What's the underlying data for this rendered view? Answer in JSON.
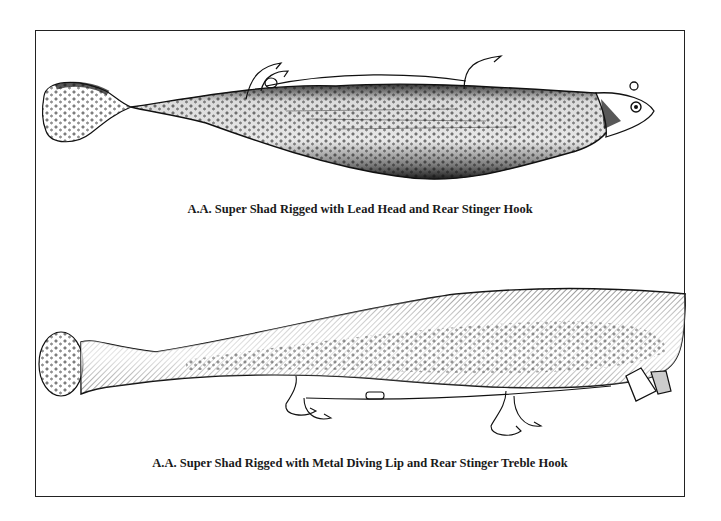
{
  "figures": [
    {
      "caption": "A.A. Super Shad Rigged with Lead Head and Rear Stinger Hook",
      "subject": "soft plastic shad lure with lead jig head and rear stinger hook",
      "icon": "fishing-lure-leadhead-illustration"
    },
    {
      "caption": "A.A. Super Shad Rigged with Metal Diving Lip and Rear Stinger Treble Hook",
      "subject": "soft plastic shad lure with metal diving lip and treble hooks",
      "icon": "fishing-lure-diving-lip-illustration"
    }
  ],
  "colors": {
    "ink": "#111111",
    "paper": "#ffffff",
    "frame": "#222222"
  }
}
